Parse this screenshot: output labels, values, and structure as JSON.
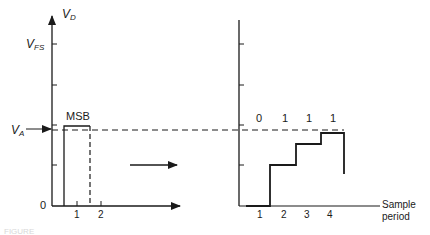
{
  "left_plot": {
    "y_axis_label": "V",
    "y_axis_sub": "D",
    "vfs_label": "V",
    "vfs_sub": "FS",
    "va_label": "V",
    "va_sub": "A",
    "origin_label": "0",
    "msb_label": "MSB",
    "x_ticks": [
      "1",
      "2"
    ]
  },
  "right_plot": {
    "bits": [
      "0",
      "1",
      "1",
      "1"
    ],
    "x_ticks": [
      "1",
      "2",
      "3",
      "4"
    ],
    "x_axis_label_line1": "Sample",
    "x_axis_label_line2": "period"
  },
  "caption": "FIGURE"
}
